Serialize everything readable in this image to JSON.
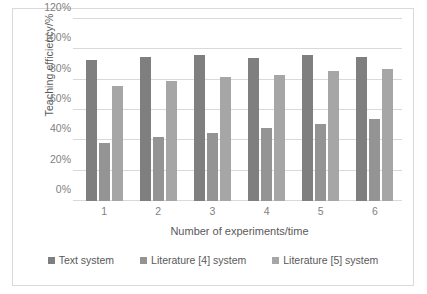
{
  "chart_data": {
    "type": "bar",
    "title": "",
    "subtitle": "",
    "xlabel": "Number of experiments/time",
    "ylabel": "Teaching efficiency/%",
    "categories": [
      "1",
      "2",
      "3",
      "4",
      "5",
      "6"
    ],
    "series": [
      {
        "name": "Text system",
        "color": "#7f7f7f",
        "values": [
          93,
          95,
          96,
          94,
          96,
          95
        ]
      },
      {
        "name": "Literature [4] system",
        "color": "#949494",
        "values": [
          38,
          42,
          45,
          48,
          51,
          54
        ]
      },
      {
        "name": "Literature [5] system",
        "color": "#a6a6a6",
        "values": [
          76,
          79,
          82,
          83,
          86,
          87
        ]
      }
    ],
    "ylim": [
      0,
      120
    ],
    "ytick_labels": [
      "0%",
      "20%",
      "40%",
      "60%",
      "80%",
      "100%",
      "120%"
    ],
    "ytick_values": [
      0,
      20,
      40,
      60,
      80,
      100,
      120
    ],
    "grid": "horizontal",
    "legend_position": "bottom",
    "border_color": "#d9d9d9",
    "gridline_color": "#d9d9d9",
    "background": "#ffffff"
  }
}
